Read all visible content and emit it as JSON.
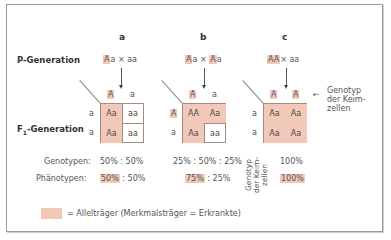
{
  "columns": [
    {
      "label": "a",
      "parents": {
        "p1_hl": "A",
        "p1_rest": "a",
        "cross": "×",
        "p2_hl": "",
        "p2_rest": "aa"
      },
      "gametes_top": [
        {
          "text": "A",
          "hl": true
        },
        {
          "text": "a",
          "hl": false
        }
      ],
      "gametes_left": [
        {
          "text": "a",
          "hl": false
        },
        {
          "text": "a",
          "hl": false
        }
      ],
      "cells": [
        [
          "Aa",
          "aa"
        ],
        [
          "Aa",
          "aa"
        ]
      ],
      "genotypes": "50% : 50%",
      "phenotypes_hl": "50%",
      "phenotypes_rest": " : 50%"
    },
    {
      "label": "b",
      "parents": {
        "p1_hl": "A",
        "p1_rest": "a",
        "cross": "×",
        "p2_hl": "A",
        "p2_rest": "a"
      },
      "gametes_top": [
        {
          "text": "A",
          "hl": true
        },
        {
          "text": "a",
          "hl": false
        }
      ],
      "gametes_left": [
        {
          "text": "A",
          "hl": true
        },
        {
          "text": "a",
          "hl": false
        }
      ],
      "cells": [
        [
          "AA",
          "Aa"
        ],
        [
          "Aa",
          "aa"
        ]
      ],
      "genotypes": "25% : 50% : 25%",
      "phenotypes_hl": "75%",
      "phenotypes_rest": " : 25%"
    },
    {
      "label": "c",
      "parents": {
        "p1_hl": "AA",
        "p1_rest": "",
        "cross": "×",
        "p2_hl": "",
        "p2_rest": "aa"
      },
      "gametes_top": [
        {
          "text": "A",
          "hl": true
        },
        {
          "text": "A",
          "hl": true
        }
      ],
      "gametes_left": [
        {
          "text": "a",
          "hl": false
        },
        {
          "text": "a",
          "hl": false
        }
      ],
      "cells": [
        [
          "Aa",
          "Aa"
        ],
        [
          "Aa",
          "Aa"
        ]
      ],
      "genotypes": "100%",
      "phenotypes_hl": "100%",
      "phenotypes_rest": ""
    }
  ],
  "rows": {
    "p_generation": "P-Generation",
    "f1_generation_prefix": "F",
    "f1_generation_sub": "1",
    "f1_generation_suffix": "-Generation",
    "genotypes": "Genotypen:",
    "phenotypes": "Phänotypen:"
  },
  "annotations": {
    "gamete_note_line1": "Genotyp",
    "gamete_note_line2": "der Keim-",
    "gamete_note_line3": "zellen",
    "vertical_note_line1": "Genotyp",
    "vertical_note_line2": "der Keim-",
    "vertical_note_line3": "zellen",
    "arrow_left": "←"
  },
  "legend": {
    "text": "= Allelträger (Merkmalsträger = Erkrankte)",
    "swatch_color": "#f2c9b8"
  },
  "colors": {
    "highlight": "#f2c9b8",
    "grid_border": "#a58a80"
  }
}
